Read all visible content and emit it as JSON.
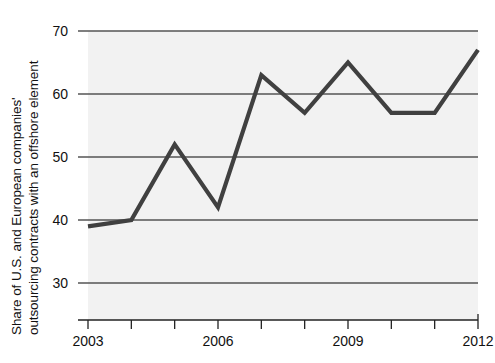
{
  "chart_data": {
    "type": "line",
    "title": "",
    "subtitle": "",
    "xlabel": "",
    "ylabel": "Share of U.S. and European companies' outsourcing contracts with an offshore element",
    "ylabel_line1": "Share of U.S. and European companies'",
    "ylabel_line2": "outsourcing contracts with an offshore element",
    "x": [
      2003,
      2004,
      2005,
      2006,
      2007,
      2008,
      2009,
      2010,
      2011,
      2012
    ],
    "values": [
      39,
      40,
      52,
      42,
      63,
      57,
      65,
      57,
      57,
      67
    ],
    "series": [
      {
        "name": "Share with an offshore element",
        "values": [
          39,
          40,
          52,
          42,
          63,
          57,
          65,
          57,
          57,
          67
        ]
      }
    ],
    "xlim": [
      2003,
      2012
    ],
    "ylim": [
      26,
      72
    ],
    "ytick_values": [
      30,
      40,
      50,
      60,
      70
    ],
    "ytick_labels": [
      "30",
      "40",
      "50",
      "60",
      "70"
    ],
    "xtick_values": [
      2003,
      2004,
      2005,
      2006,
      2007,
      2008,
      2009,
      2010,
      2011,
      2012
    ],
    "xtick_labels": [
      "2003",
      "",
      "",
      "2006",
      "",
      "",
      "2009",
      "",
      "",
      "2012"
    ],
    "xtick_labels_shown": [
      "2003",
      "2006",
      "2009",
      "2012"
    ],
    "grid": "horizontal",
    "legend": "none",
    "colors": {
      "line": "#404040",
      "grid": "#555555",
      "axis": "#222222",
      "plot_background": "#f2f2f2",
      "page_background": "#ffffff",
      "text": "#111111"
    }
  },
  "ytick_labels": [
    {
      "text": "70",
      "value": 70
    },
    {
      "text": "60",
      "value": 60
    },
    {
      "text": "50",
      "value": 50
    },
    {
      "text": "40",
      "value": 40
    },
    {
      "text": "30",
      "value": 30
    }
  ],
  "xtick_labels": [
    {
      "text": "2003",
      "value": 2003
    },
    {
      "text": "2006",
      "value": 2006
    },
    {
      "text": "2009",
      "value": 2009
    },
    {
      "text": "2012",
      "value": 2012
    }
  ],
  "axis_title": {
    "line1": "Share of U.S. and European companies'",
    "line2": "outsourcing contracts with an offshore element"
  }
}
